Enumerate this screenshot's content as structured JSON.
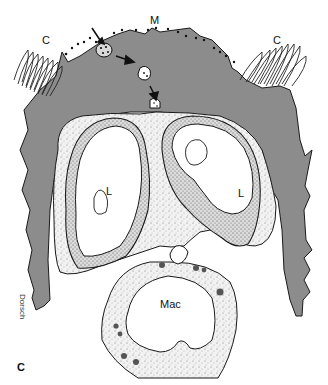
{
  "figure": {
    "panel_letter": "C",
    "labels": {
      "cilia_left": "C",
      "cilia_right": "C",
      "microvilli": "M",
      "lysosome_left": "L",
      "lysosome_right": "L",
      "macrophage": "Mac"
    },
    "colors": {
      "cytoplasm_gray": "#8c8c8c",
      "outline": "#1a1a1a",
      "stipple_fill": "#ededed",
      "background": "#ffffff"
    },
    "signature": "Dorsch"
  }
}
